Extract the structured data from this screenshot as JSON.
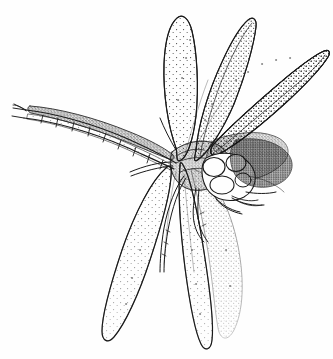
{
  "figure": {
    "plate_label": "(a)",
    "edge_fragment": "5",
    "technique": "pen-and-ink stipple illustration",
    "background_color": "#fefefe",
    "ink_color": "#1a1a1a",
    "stipple_color": "#2a2a2a",
    "canvas": {
      "width": 333,
      "height": 359
    }
  },
  "anatomy": {
    "parts": [
      {
        "name": "forewing-upper-left",
        "label": "left forewing",
        "orientation": "swept up and right"
      },
      {
        "name": "forewing-upper-right",
        "label": "right forewing",
        "orientation": "swept up and right"
      },
      {
        "name": "hindwing-lower-left",
        "label": "left hindwing",
        "orientation": "hanging down"
      },
      {
        "name": "hindwing-lower-right",
        "label": "right hindwing",
        "orientation": "hanging down"
      },
      {
        "name": "abdomen",
        "label": "segmented abdomen",
        "segments": 9
      },
      {
        "name": "cerci",
        "label": "terminal cerci"
      },
      {
        "name": "thorax",
        "label": "thorax"
      },
      {
        "name": "head",
        "label": "head"
      },
      {
        "name": "compound-eye-left",
        "label": "left compound eye"
      },
      {
        "name": "compound-eye-right",
        "label": "right compound eye"
      },
      {
        "name": "legs",
        "label": "legs",
        "count": 6
      }
    ]
  }
}
